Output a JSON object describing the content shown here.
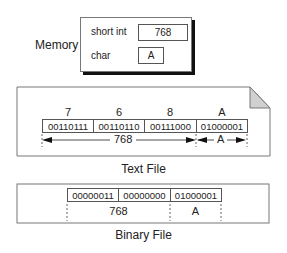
{
  "memory": {
    "label": "Memory",
    "rows": [
      {
        "type": "short int",
        "value": "768"
      },
      {
        "type": "char",
        "value": "A"
      }
    ]
  },
  "text_file": {
    "caption": "Text File",
    "characters": [
      "7",
      "6",
      "8",
      "A"
    ],
    "bytes": [
      "00110111",
      "00110110",
      "00111000",
      "01000001"
    ],
    "spans": [
      {
        "label": "768",
        "covers_bytes": 3
      },
      {
        "label": "A",
        "covers_bytes": 1
      }
    ]
  },
  "binary_file": {
    "caption": "Binary File",
    "bytes": [
      "00000011",
      "00000000",
      "01000001"
    ],
    "spans": [
      {
        "label": "768",
        "covers_bytes": 2
      },
      {
        "label": "A",
        "covers_bytes": 1
      }
    ]
  }
}
